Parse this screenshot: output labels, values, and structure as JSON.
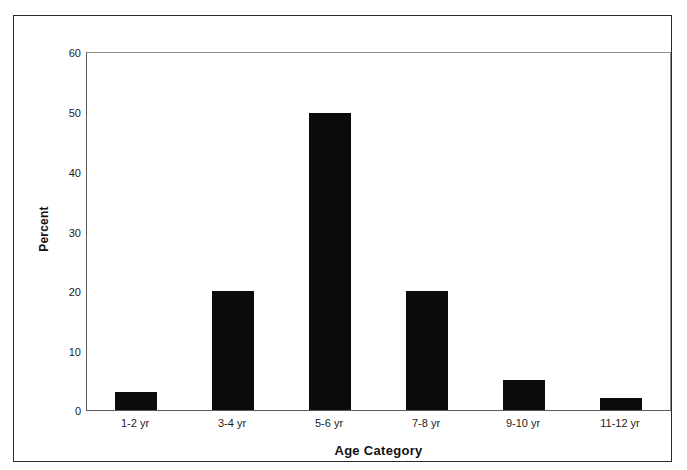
{
  "chart_data": {
    "type": "bar",
    "title": "",
    "subtitle": "",
    "xlabel": "Age Category",
    "ylabel": "Percent",
    "categories": [
      "1-2 yr",
      "3-4 yr",
      "5-6 yr",
      "7-8 yr",
      "9-10 yr",
      "11-12 yr"
    ],
    "values": [
      3,
      20,
      50,
      20,
      5,
      2
    ],
    "ylim": [
      0,
      60
    ],
    "yticks": [
      0,
      10,
      20,
      30,
      40,
      50,
      60
    ],
    "ytick_labels": [
      "0",
      "10",
      "20",
      "30",
      "40",
      "50",
      "60"
    ],
    "grid": false,
    "legend": null,
    "bar_color": "#0b0b0b",
    "axis_color": "#5a5a5a",
    "background": "#ffffff",
    "annotations": []
  },
  "axes": {
    "y_title": "Percent",
    "x_title": "Age Category"
  },
  "ytick_labels": {
    "t0": "60",
    "t1": "50",
    "t2": "40",
    "t3": "30",
    "t4": "20",
    "t5": "10",
    "t6": "0"
  },
  "xtick_labels": {
    "c0": "1-2 yr",
    "c1": "3-4 yr",
    "c2": "5-6 yr",
    "c3": "7-8 yr",
    "c4": "9-10 yr",
    "c5": "11-12 yr"
  }
}
